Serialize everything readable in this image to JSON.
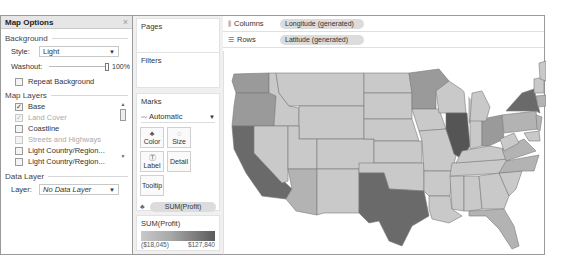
{
  "map_options": {
    "title": "Map Options",
    "close_icon": "×",
    "background": {
      "section_label": "Background",
      "style_label": "Style:",
      "style_value": "Light",
      "washout_label": "Washout:",
      "washout_value": "100%",
      "repeat_background_label": "Repeat Background",
      "repeat_background_checked": false
    },
    "map_layers": {
      "section_label": "Map Layers",
      "items": [
        {
          "label": "Base",
          "checked": true,
          "disabled": false
        },
        {
          "label": "Land Cover",
          "checked": true,
          "disabled": true
        },
        {
          "label": "Coastline",
          "checked": false,
          "disabled": false
        },
        {
          "label": "Streets and Highways",
          "checked": false,
          "disabled": true
        },
        {
          "label": "Light Country/Region...",
          "checked": false,
          "disabled": false
        },
        {
          "label": "Light Country/Region...",
          "checked": false,
          "disabled": false
        }
      ]
    },
    "data_layer": {
      "section_label": "Data Layer",
      "layer_label": "Layer:",
      "layer_value": "No Data Layer"
    }
  },
  "cards": {
    "pages_title": "Pages",
    "filters_title": "Filters",
    "marks": {
      "title": "Marks",
      "mark_type": "Automatic",
      "buttons": [
        {
          "label": "Color",
          "icon": "color-icon"
        },
        {
          "label": "Size",
          "icon": "size-icon"
        },
        {
          "label": "Label",
          "icon": "label-icon"
        },
        {
          "label": "Detail",
          "icon": "detail-icon"
        },
        {
          "label": "Tooltip",
          "icon": "tooltip-icon"
        }
      ],
      "pills": [
        {
          "label": "SUM(Profit)",
          "icon": "color-icon"
        },
        {
          "label": "State",
          "icon": "detail-icon"
        }
      ]
    },
    "legend": {
      "title": "SUM(Profit)",
      "min": "($18,045)",
      "max": "$127,840"
    }
  },
  "shelves": {
    "columns_label": "Columns",
    "columns_pill": "Longitude (generated)",
    "rows_label": "Rows",
    "rows_pill": "Latitude (generated)"
  },
  "map": {
    "measure": "SUM(Profit)",
    "dimension": "State",
    "colors": {
      "light": "#c9c9c9",
      "mid_light": "#b3b3b3",
      "mid": "#9a9a9a",
      "dark": "#6a6a6a",
      "darkest": "#555555",
      "border": "#7a7a7a"
    }
  }
}
